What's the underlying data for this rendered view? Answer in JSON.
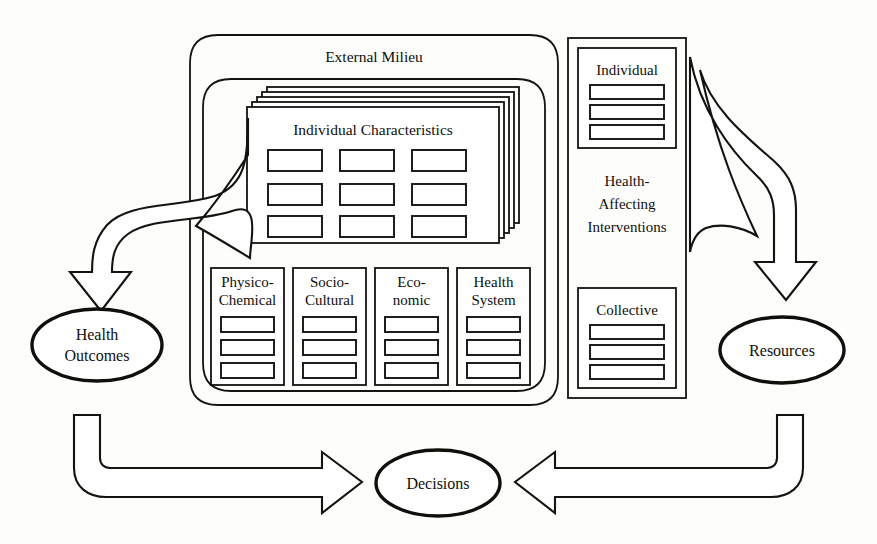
{
  "diagram": {
    "background_color": "#fdfdfb",
    "line_color": "#15130f",
    "containers": {
      "external_milieu": {
        "label": "External Milieu"
      },
      "individual_characteristics": {
        "label": "Individual Characteristics",
        "stack_count": 4,
        "grid_rows": 3,
        "grid_cols": 3
      },
      "interventions": {
        "label_line1": "Health-",
        "label_line2": "Affecting",
        "label_line3": "Interventions"
      }
    },
    "domain_boxes": [
      {
        "line1": "Physico-",
        "line2": "Chemical",
        "bars": 3
      },
      {
        "line1": "Socio-",
        "line2": "Cultural",
        "bars": 3
      },
      {
        "line1": "Eco-",
        "line2": "nomic",
        "bars": 3
      },
      {
        "line1": "Health",
        "line2": "System",
        "bars": 3
      }
    ],
    "intervention_boxes": [
      {
        "label": "Individual",
        "bars": 3
      },
      {
        "label": "Collective",
        "bars": 3
      }
    ],
    "nodes": [
      {
        "id": "health-outcomes",
        "line1": "Health",
        "line2": "Outcomes"
      },
      {
        "id": "resources",
        "line1": "Resources",
        "line2": ""
      },
      {
        "id": "decisions",
        "line1": "Decisions",
        "line2": ""
      }
    ],
    "arrows": [
      {
        "id": "characteristics-to-health-outcomes",
        "direction": "down-left",
        "style": "curved-ribbon"
      },
      {
        "id": "interventions-to-resources",
        "direction": "down-right",
        "style": "curved-ribbon"
      },
      {
        "id": "health-outcomes-to-decisions",
        "direction": "right",
        "style": "elbow"
      },
      {
        "id": "resources-to-decisions",
        "direction": "left",
        "style": "elbow"
      }
    ]
  }
}
